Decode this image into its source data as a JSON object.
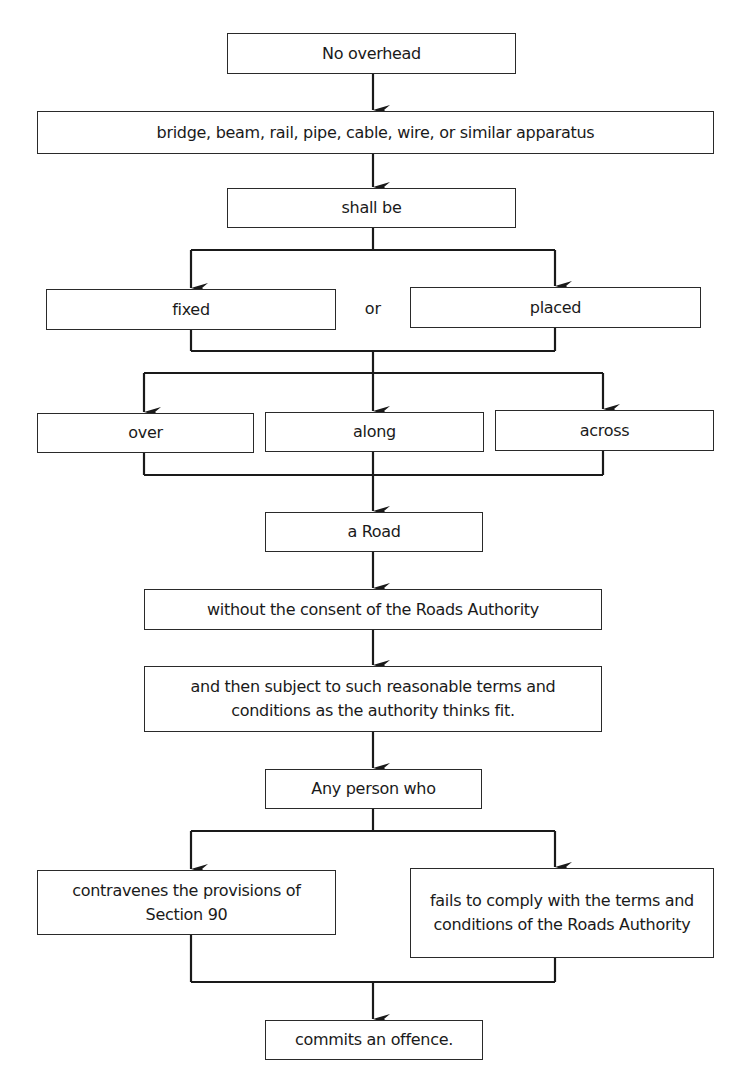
{
  "diagram": {
    "type": "flowchart",
    "nodes": {
      "no_overhead": "No overhead",
      "apparatus": "bridge, beam, rail, pipe, cable, wire, or similar apparatus",
      "shall_be": "shall be",
      "fixed": "fixed",
      "or": "or",
      "placed": "placed",
      "over": "over",
      "along": "along",
      "across": "across",
      "a_road": "a Road",
      "without_consent": "without the consent of the Roads Authority",
      "subject_to": "and then subject to such reasonable terms and conditions as the authority thinks fit.",
      "any_person": "Any person who",
      "contravenes": "contravenes the provisions of Section 90",
      "fails_to_comply": "fails to comply with the terms and conditions of the Roads Authority",
      "commits_offence": "commits an offence."
    },
    "edges": [
      [
        "no_overhead",
        "apparatus"
      ],
      [
        "apparatus",
        "shall_be"
      ],
      [
        "shall_be",
        "fixed"
      ],
      [
        "shall_be",
        "placed"
      ],
      [
        "fixed",
        "over"
      ],
      [
        "fixed",
        "along"
      ],
      [
        "fixed",
        "across"
      ],
      [
        "placed",
        "over"
      ],
      [
        "placed",
        "along"
      ],
      [
        "placed",
        "across"
      ],
      [
        "over",
        "a_road"
      ],
      [
        "along",
        "a_road"
      ],
      [
        "across",
        "a_road"
      ],
      [
        "a_road",
        "without_consent"
      ],
      [
        "without_consent",
        "subject_to"
      ],
      [
        "subject_to",
        "any_person"
      ],
      [
        "any_person",
        "contravenes"
      ],
      [
        "any_person",
        "fails_to_comply"
      ],
      [
        "contravenes",
        "commits_offence"
      ],
      [
        "fails_to_comply",
        "commits_offence"
      ]
    ],
    "colors": {
      "line": "#1a1a1a",
      "box_border": "#2a2a2a",
      "background": "#ffffff",
      "text": "#1a1a1a"
    }
  }
}
